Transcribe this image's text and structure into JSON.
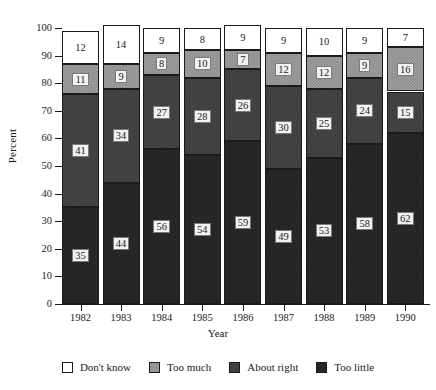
{
  "chart_data": {
    "type": "bar",
    "title": "",
    "subtitle": "",
    "xlabel": "Year",
    "ylabel": "Percent",
    "ylim": [
      0,
      100
    ],
    "yticks": [
      0,
      10,
      20,
      30,
      40,
      50,
      60,
      70,
      80,
      90,
      100
    ],
    "ytick_labels": [
      "0",
      "10",
      "20",
      "30",
      "40",
      "50",
      "60",
      "70",
      "80",
      "90",
      "100"
    ],
    "grid": false,
    "stacked": true,
    "stack_order_bottom_to_top": [
      "Too little",
      "About right",
      "Too much",
      "Don't know"
    ],
    "legend_position": "bottom",
    "categories": [
      "1982",
      "1983",
      "1984",
      "1985",
      "1986",
      "1987",
      "1988",
      "1989",
      "1990"
    ],
    "series": [
      {
        "name": "Don't know",
        "color": "#ffffff",
        "values": [
          12,
          14,
          9,
          8,
          9,
          9,
          10,
          9,
          7
        ]
      },
      {
        "name": "Too much",
        "color": "#8e8e8e",
        "values": [
          11,
          9,
          8,
          10,
          7,
          12,
          12,
          9,
          16
        ]
      },
      {
        "name": "About right",
        "color": "#3b3b3b",
        "values": [
          41,
          34,
          27,
          28,
          26,
          30,
          25,
          24,
          15
        ]
      },
      {
        "name": "Too little",
        "color": "#232323",
        "values": [
          35,
          44,
          56,
          54,
          59,
          49,
          53,
          58,
          62
        ]
      }
    ]
  },
  "legend": {
    "items": [
      {
        "label": "Don't know",
        "swatch": "legend-swatch-dont-know"
      },
      {
        "label": "Too much",
        "swatch": "legend-swatch-too-much"
      },
      {
        "label": "About right",
        "swatch": "legend-swatch-about-right"
      },
      {
        "label": "Too little",
        "swatch": "legend-swatch-too-little"
      }
    ]
  }
}
